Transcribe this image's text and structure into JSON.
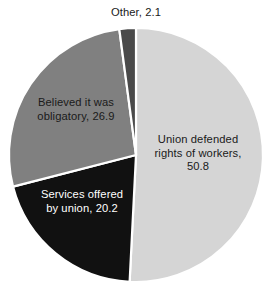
{
  "chart_data": {
    "type": "pie",
    "title": "",
    "subtitle": "",
    "xlabel": "",
    "ylabel": "",
    "legend": "none",
    "grid": false,
    "units": "percent",
    "total": 100.0,
    "categories": [
      "Union defended rights of workers",
      "Services offered by union",
      "Believed it was obligatory",
      "Other"
    ],
    "values": [
      50.8,
      20.2,
      26.9,
      2.1
    ],
    "colors": [
      "#d5d5d5",
      "#111111",
      "#808080",
      "#4a4a4a"
    ],
    "slices": [
      {
        "name": "union-defended",
        "label": "Union defended\nrights of workers,\n50.8",
        "category": "Union defended rights of workers",
        "value": 50.8,
        "color": "#d5d5d5",
        "label_color": "#1a1a1a",
        "label_position": "inside"
      },
      {
        "name": "services-offered",
        "label": "Services offered\nby union, 20.2",
        "category": "Services offered by union",
        "value": 20.2,
        "color": "#111111",
        "label_color": "#ffffff",
        "label_position": "inside"
      },
      {
        "name": "believed-obligatory",
        "label": "Believed it was\nobligatory, 26.9",
        "category": "Believed it was obligatory",
        "value": 26.9,
        "color": "#808080",
        "label_color": "#1a1a1a",
        "label_position": "inside"
      },
      {
        "name": "other",
        "label": "Other, 2.1",
        "category": "Other",
        "value": 2.1,
        "color": "#4a4a4a",
        "label_color": "#1a1a1a",
        "label_position": "outside-top"
      }
    ],
    "geometry": {
      "center_x": 136,
      "center_y": 155,
      "radius": 127,
      "start_angle_deg": 0,
      "direction": "clockwise",
      "separator_color": "#ffffff"
    },
    "background": "#ffffff"
  }
}
